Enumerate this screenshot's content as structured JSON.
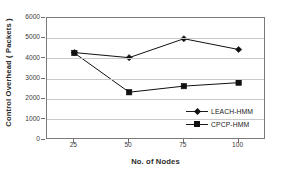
{
  "chart_data": {
    "type": "line",
    "title": "",
    "xlabel": "No. of Nodes",
    "ylabel": "Control Overhead ( Packets )",
    "categories": [
      "25",
      "50",
      "75",
      "100"
    ],
    "x": [
      25,
      50,
      75,
      100
    ],
    "series": [
      {
        "name": "LEACH-HMM",
        "marker": "diamond",
        "color": "#111111",
        "values": [
          4300,
          4050,
          4980,
          4450
        ]
      },
      {
        "name": "CPCP-HMM",
        "marker": "square",
        "color": "#111111",
        "values": [
          4280,
          2350,
          2650,
          2820
        ]
      }
    ],
    "ylim": [
      0,
      6000
    ],
    "ytick_values": [
      0,
      1000,
      2000,
      3000,
      4000,
      5000,
      6000
    ],
    "ytick_labels": [
      "0",
      "1000",
      "2000",
      "3000",
      "4000",
      "5000",
      "6000"
    ],
    "xtick_labels": [
      "25",
      "50",
      "75",
      "100"
    ],
    "grid": "horizontal",
    "grid_color": "#c9c9c9",
    "legend_position": "inside-bottom-right",
    "plot_border_color": "#7a7a7a",
    "background_color": "#ffffff"
  },
  "legend": {
    "entries": [
      {
        "label": "LEACH-HMM"
      },
      {
        "label": "CPCP-HMM"
      }
    ]
  },
  "axes": {
    "y_title": "Control Overhead ( Packets )",
    "x_title": "No. of Nodes",
    "y_labels": [
      "6000",
      "5000",
      "4000",
      "3000",
      "2000",
      "1000",
      "0"
    ],
    "x_labels": [
      "25",
      "50",
      "75",
      "100"
    ]
  }
}
